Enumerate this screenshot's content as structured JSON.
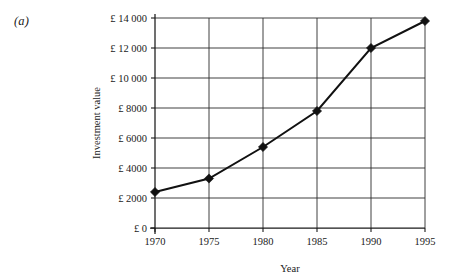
{
  "panel": {
    "label": "(a)"
  },
  "chart_data": {
    "type": "line",
    "title": "",
    "xlabel": "Year",
    "ylabel": "Investment value",
    "categories": [
      1970,
      1975,
      1980,
      1985,
      1990,
      1995
    ],
    "x": [
      1970,
      1975,
      1980,
      1985,
      1990,
      1995
    ],
    "values": [
      2400,
      3300,
      5400,
      7800,
      12000,
      13800
    ],
    "series": [
      {
        "name": "Investment value",
        "values": [
          2400,
          3300,
          5400,
          7800,
          12000,
          13800
        ]
      }
    ],
    "xlim": [
      1970,
      1995
    ],
    "ylim": [
      0,
      14000
    ],
    "x_tick_labels": [
      "1970",
      "1975",
      "1980",
      "1985",
      "1990",
      "1995"
    ],
    "y_ticks": [
      0,
      2000,
      4000,
      6000,
      8000,
      10000,
      12000,
      14000
    ],
    "y_tick_labels": [
      "£ 0",
      "£ 2000",
      "£ 4000",
      "£ 6000",
      "£ 8000",
      "£ 10 000",
      "£ 12 000",
      "£ 14 000"
    ],
    "grid": true,
    "legend": false,
    "marker": "diamond",
    "line_color": "#111111",
    "marker_color": "#111111",
    "grid_color": "#2b2b2b",
    "background_color": "#ffffff"
  }
}
